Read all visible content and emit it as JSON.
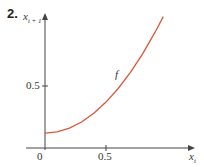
{
  "figure": {
    "number": "2.",
    "curve_label": "f"
  },
  "chart_data": {
    "type": "line",
    "title": "",
    "xlabel": "x_t",
    "ylabel": "x_{t+1}",
    "x_ticks": [
      "0",
      "0.5"
    ],
    "y_ticks": [
      "0.5"
    ],
    "xlim": [
      0,
      1.0
    ],
    "ylim": [
      0,
      1.1
    ],
    "grid": false,
    "series": [
      {
        "name": "f",
        "color": "#d9573a",
        "x": [
          0,
          0.1,
          0.2,
          0.3,
          0.4,
          0.5,
          0.6,
          0.7,
          0.8,
          0.9,
          0.97
        ],
        "y": [
          0.12,
          0.13,
          0.16,
          0.21,
          0.28,
          0.37,
          0.48,
          0.61,
          0.76,
          0.93,
          1.06
        ]
      }
    ]
  },
  "labels": {
    "y_axis_main": "x",
    "y_axis_sub": "t + 1",
    "x_axis_main": "x",
    "x_axis_sub": "t",
    "origin": "0",
    "x_tick_half": "0.5",
    "y_tick_half": "0.5"
  }
}
